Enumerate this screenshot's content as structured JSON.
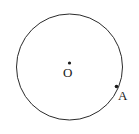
{
  "figure": {
    "type": "geometry-diagram",
    "background_color": "#ffffff",
    "stroke_color": "#2b2b2b",
    "stroke_width": 1,
    "width": 139,
    "height": 134,
    "circle": {
      "name": "main-circle",
      "center_x": 69.5,
      "center_y": 67,
      "radius": 53,
      "fill": "none"
    },
    "points": [
      {
        "id": "center",
        "label": "O",
        "x": 69.5,
        "y": 63,
        "dot_radius": 1.6,
        "color": "#1a1a1a",
        "label_x": 63,
        "label_y": 66
      },
      {
        "id": "point-a",
        "label": "A",
        "x": 116.5,
        "y": 86.5,
        "dot_radius": 1.8,
        "color": "#1a1a1a",
        "label_x": 118,
        "label_y": 89
      }
    ]
  }
}
